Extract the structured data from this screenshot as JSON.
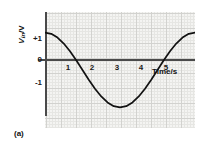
{
  "figure": {
    "caption": "(a)",
    "background_color": "#ffffff",
    "grid_color": "#e6e6e3",
    "grid_major_color": "#d2d2cf",
    "grid_fill_color": "#f4f4f2",
    "axis_color": "#4a4a4a",
    "curve_color": "#111111"
  },
  "chart_data": {
    "type": "line",
    "title": "",
    "subtitle": "",
    "xlabel": "Time/s",
    "ylabel": "V_in/V",
    "ylabel_symbol": "V",
    "ylabel_subscript": "in",
    "ylabel_unit": "/V",
    "xlim": [
      0,
      6
    ],
    "ylim": [
      -1.55,
      1.55
    ],
    "grid": true,
    "legend": null,
    "legend_position": "none",
    "xticks": [
      1,
      2,
      3,
      4,
      5
    ],
    "xtick_labels": [
      "1",
      "2",
      "3",
      "4",
      "5"
    ],
    "yticks": [
      1,
      0,
      -1
    ],
    "ytick_labels": [
      "+1",
      "0",
      "-1"
    ],
    "annotations": [],
    "series": [
      {
        "name": "Vin",
        "equation": "V = cos(2*pi*t/6)",
        "amplitude": 1,
        "period": 6,
        "x": [
          0,
          0.25,
          0.5,
          0.75,
          1,
          1.25,
          1.5,
          1.75,
          2,
          2.25,
          2.5,
          2.75,
          3,
          3.25,
          3.5,
          3.75,
          4,
          4.25,
          4.5,
          4.75,
          5,
          5.25,
          5.5,
          5.75,
          6
        ],
        "values": [
          1,
          0.966,
          0.866,
          0.707,
          0.5,
          0.259,
          0,
          -0.259,
          -0.5,
          -0.707,
          -0.866,
          -0.966,
          -1,
          -0.966,
          -0.866,
          -0.707,
          -0.5,
          -0.259,
          0,
          0.259,
          0.5,
          0.707,
          0.866,
          0.966,
          1
        ]
      }
    ]
  }
}
